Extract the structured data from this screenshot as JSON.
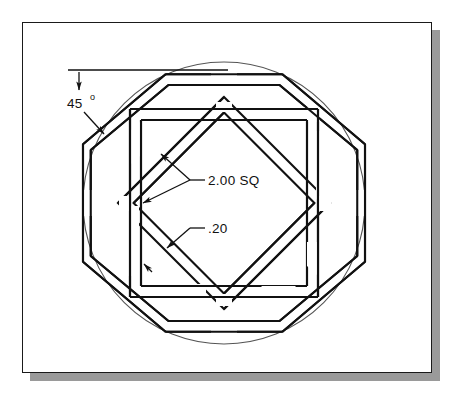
{
  "drawing": {
    "title": "Interlaced octagon, square and diamond ring assembly",
    "sheet": {
      "border_color": "#1a1a1a",
      "background_color": "#ffffff",
      "shadow_color": "#9a9a9a"
    },
    "line_color": "#111111",
    "construction_color": "#555555",
    "annotations": [
      {
        "id": "angle-45",
        "label": "45",
        "superscript": "o",
        "full_text": "45°",
        "type": "angular-dimension",
        "points_to": "octagon-upper-left-chamfer"
      },
      {
        "id": "square-size",
        "label": "2.00 SQ",
        "type": "leader-dimension",
        "points_to": "band-width-across-flats",
        "arrow_count": 2
      },
      {
        "id": "band-thickness",
        "label": ".20",
        "type": "leader-dimension",
        "points_to": "diagonal-band-width",
        "arrow_count": 1
      }
    ],
    "geometry": {
      "circle": {
        "cx": 224,
        "cy": 203,
        "r": 141,
        "style": "construction-thin"
      },
      "octagon_band": {
        "outer_radius": 141,
        "inner_radius": 130,
        "rotation_deg": 22.5
      },
      "square_band": {
        "outer_half": 94,
        "inner_half": 83,
        "rotation_deg": 0
      },
      "diamond_band": {
        "outer_half": 106,
        "inner_half": 95,
        "rotation_deg": 45
      }
    }
  }
}
